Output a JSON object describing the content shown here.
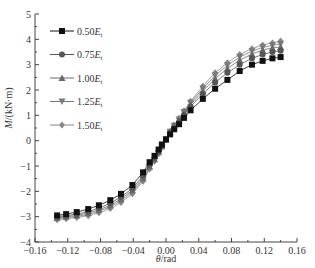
{
  "chart_data": {
    "type": "line",
    "title": "",
    "xlabel_italic": "θ",
    "xlabel_rest": "/rad",
    "ylabel_italic": "M",
    "ylabel_rest": "/(kN·m)",
    "xlim": [
      -0.16,
      0.16
    ],
    "ylim": [
      -4,
      5
    ],
    "xticks": [
      -0.16,
      -0.12,
      -0.08,
      -0.04,
      0.0,
      0.04,
      0.08,
      0.12,
      0.16
    ],
    "xtick_labels": [
      "−0.16",
      "−0.12",
      "−0.08",
      "−0.04",
      "0.00",
      "0.04",
      "0.08",
      "0.12",
      "0.16"
    ],
    "yticks": [
      -4,
      -3,
      -2,
      -1,
      0,
      1,
      2,
      3,
      4,
      5
    ],
    "ytick_labels": [
      "−4",
      "−3",
      "−2",
      "−1",
      "0",
      "1",
      "2",
      "3",
      "4",
      "5"
    ],
    "grid": false,
    "legend_position": "top-left",
    "x": [
      -0.133,
      -0.122,
      -0.109,
      -0.095,
      -0.082,
      -0.068,
      -0.055,
      -0.041,
      -0.028,
      -0.02,
      -0.014,
      -0.009,
      -0.005,
      0.0,
      0.005,
      0.01,
      0.016,
      0.022,
      0.03,
      0.045,
      0.06,
      0.075,
      0.09,
      0.105,
      0.118,
      0.13,
      0.14
    ],
    "series": [
      {
        "name": "0.50",
        "subscript": "t",
        "marker": "square",
        "color": "#111111",
        "values": [
          -2.95,
          -2.9,
          -2.82,
          -2.7,
          -2.55,
          -2.35,
          -2.1,
          -1.75,
          -1.25,
          -0.85,
          -0.6,
          -0.35,
          -0.15,
          0.05,
          0.25,
          0.45,
          0.65,
          0.9,
          1.2,
          1.65,
          2.05,
          2.4,
          2.75,
          3.0,
          3.15,
          3.25,
          3.3
        ]
      },
      {
        "name": "0.75",
        "subscript": "t",
        "marker": "circle",
        "color": "#555555",
        "values": [
          -3.0,
          -2.96,
          -2.9,
          -2.8,
          -2.66,
          -2.47,
          -2.22,
          -1.88,
          -1.38,
          -0.95,
          -0.68,
          -0.42,
          -0.2,
          0.05,
          0.3,
          0.52,
          0.75,
          1.02,
          1.35,
          1.85,
          2.3,
          2.68,
          3.0,
          3.25,
          3.4,
          3.5,
          3.55
        ]
      },
      {
        "name": "1.00",
        "subscript": "t",
        "marker": "triangle-up",
        "color": "#6a6a6a",
        "values": [
          -3.05,
          -3.0,
          -2.95,
          -2.86,
          -2.73,
          -2.55,
          -2.3,
          -1.96,
          -1.47,
          -1.02,
          -0.73,
          -0.46,
          -0.22,
          0.05,
          0.33,
          0.56,
          0.8,
          1.08,
          1.43,
          1.96,
          2.45,
          2.85,
          3.18,
          3.42,
          3.58,
          3.66,
          3.7
        ]
      },
      {
        "name": "1.25",
        "subscript": "t",
        "marker": "triangle-down",
        "color": "#7a7a7a",
        "values": [
          -3.08,
          -3.04,
          -2.99,
          -2.91,
          -2.79,
          -2.61,
          -2.37,
          -2.03,
          -1.54,
          -1.07,
          -0.77,
          -0.49,
          -0.24,
          0.05,
          0.35,
          0.59,
          0.84,
          1.13,
          1.5,
          2.06,
          2.57,
          2.97,
          3.3,
          3.53,
          3.68,
          3.76,
          3.82
        ]
      },
      {
        "name": "1.50",
        "subscript": "t",
        "marker": "diamond",
        "color": "#888888",
        "values": [
          -3.12,
          -3.08,
          -3.03,
          -2.96,
          -2.85,
          -2.68,
          -2.44,
          -2.1,
          -1.6,
          -1.12,
          -0.81,
          -0.52,
          -0.26,
          0.05,
          0.37,
          0.62,
          0.88,
          1.18,
          1.56,
          2.15,
          2.68,
          3.08,
          3.4,
          3.63,
          3.78,
          3.86,
          3.93
        ]
      }
    ],
    "legend_entries": [
      {
        "value": "0.50",
        "E": "E",
        "sub": "t"
      },
      {
        "value": "0.75",
        "E": "E",
        "sub": "t"
      },
      {
        "value": "1.00",
        "E": "E",
        "sub": "t"
      },
      {
        "value": "1.25",
        "E": "E",
        "sub": "t"
      },
      {
        "value": "1.50",
        "E": "E",
        "sub": "t"
      }
    ]
  }
}
